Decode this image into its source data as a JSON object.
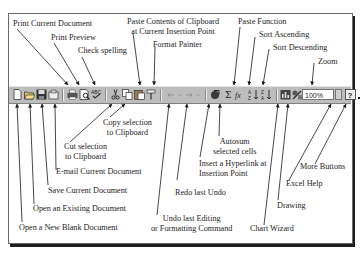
{
  "diagram": {
    "toolbar": {
      "zoom_value": "100%",
      "buttons": [
        {
          "id": "new",
          "icon": "new-document-icon"
        },
        {
          "id": "open",
          "icon": "open-folder-icon"
        },
        {
          "id": "save",
          "icon": "save-disk-icon"
        },
        {
          "id": "email",
          "icon": "email-icon"
        },
        {
          "id": "print",
          "icon": "printer-icon"
        },
        {
          "id": "preview",
          "icon": "print-preview-icon"
        },
        {
          "id": "spelling",
          "icon": "spell-check-icon"
        },
        {
          "id": "cut",
          "icon": "scissors-icon"
        },
        {
          "id": "copy",
          "icon": "copy-icon"
        },
        {
          "id": "paste",
          "icon": "paste-clipboard-icon"
        },
        {
          "id": "format_painter",
          "icon": "paintbrush-icon"
        },
        {
          "id": "undo",
          "icon": "undo-arrow-icon"
        },
        {
          "id": "redo",
          "icon": "redo-arrow-icon"
        },
        {
          "id": "hyperlink",
          "icon": "hyperlink-globe-icon"
        },
        {
          "id": "autosum",
          "icon": "sigma-icon"
        },
        {
          "id": "paste_function",
          "icon": "fx-function-icon"
        },
        {
          "id": "sort_asc",
          "icon": "sort-ascending-icon"
        },
        {
          "id": "sort_desc",
          "icon": "sort-descending-icon"
        },
        {
          "id": "chart_wizard",
          "icon": "chart-wizard-icon"
        },
        {
          "id": "drawing",
          "icon": "drawing-icon"
        },
        {
          "id": "zoom",
          "icon": "zoom-dropdown-icon"
        },
        {
          "id": "help",
          "icon": "help-question-icon"
        },
        {
          "id": "more",
          "icon": "more-buttons-icon"
        }
      ]
    },
    "labels_top": {
      "print_current": "Print Current Document",
      "print_preview": "Print Preview",
      "check_spelling": "Check spelling",
      "paste_line1": "Paste Contents of Clipboard",
      "paste_line2": "at Current Insertion Point",
      "format_painter": "Format Painter",
      "paste_function": "Paste Function",
      "sort_ascending": "Sort Ascending",
      "sort_descending": "Sort Descending",
      "zoom": "Zoom"
    },
    "labels_bottom": {
      "copy_line1": "Copy selection",
      "copy_line2": "to Clipboard",
      "cut_line1": "Cut selection",
      "cut_line2": "to Clipboard",
      "email": "E-mail Current Document",
      "save": "Save Current Document",
      "open": "Open an Existing Document",
      "new": "Open a New Blank Document",
      "undo_line1": "Undo last Editing",
      "undo_line2": "or Formatting Command",
      "redo": "Redo last Undo",
      "autosum_line1": "Autosum",
      "autosum_line2": "selected cells",
      "hyperlink_line1": "Insert a Hyperlink at",
      "hyperlink_line2": "Insertion Point",
      "chart_wizard": "Chart Wizard",
      "drawing": "Drawing",
      "excel_help": "Excel Help",
      "more_buttons": "More Buttons"
    }
  }
}
